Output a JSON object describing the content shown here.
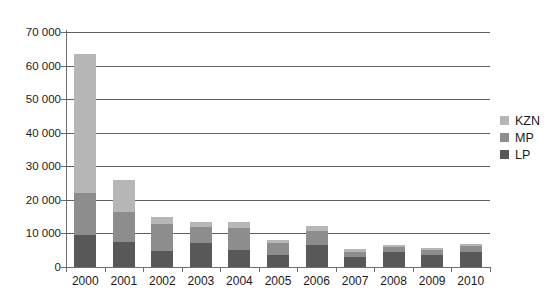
{
  "top_fragment": "",
  "chart_data": {
    "type": "bar",
    "subtype": "stacked-bar",
    "title": "",
    "xlabel": "",
    "ylabel": "",
    "categories": [
      "2000",
      "2001",
      "2002",
      "2003",
      "2004",
      "2005",
      "2006",
      "2007",
      "2008",
      "2009",
      "2010"
    ],
    "series": [
      {
        "name": "LP",
        "color": "#585858",
        "values": [
          9500,
          7400,
          4900,
          7200,
          5000,
          3500,
          6500,
          3100,
          4500,
          3500,
          4500
        ]
      },
      {
        "name": "MP",
        "color": "#8d8d8d",
        "values": [
          12500,
          8900,
          7800,
          4600,
          6600,
          3600,
          4100,
          1500,
          1400,
          1600,
          1700
        ]
      },
      {
        "name": "KZN",
        "color": "#b6b6b6",
        "values": [
          41500,
          9500,
          2300,
          1700,
          1800,
          900,
          1600,
          800,
          800,
          700,
          800
        ]
      }
    ],
    "totals": [
      63500,
      25800,
      15000,
      13500,
      13400,
      8000,
      12200,
      5400,
      6700,
      5800,
      7000
    ],
    "ylim": [
      0,
      70000
    ],
    "ytick_values": [
      0,
      10000,
      20000,
      30000,
      40000,
      50000,
      60000,
      70000
    ],
    "ytick_labels": [
      "0",
      "10 000",
      "20 000",
      "30 000",
      "40 000",
      "50 000",
      "60 000",
      "70 000"
    ],
    "grid": "horizontal",
    "legend_position": "right",
    "legend": [
      {
        "label": "KZN",
        "color": "#b6b6b6"
      },
      {
        "label": "MP",
        "color": "#8d8d8d"
      },
      {
        "label": "LP",
        "color": "#585858"
      }
    ]
  }
}
